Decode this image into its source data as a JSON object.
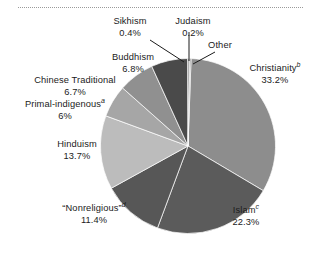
{
  "figure": {
    "type": "pie-chart",
    "rule": "dotted-separator"
  },
  "chart_data": {
    "type": "pie",
    "title": "",
    "xlabel": "",
    "ylabel": "",
    "legend_position": "callout-labels",
    "grid": false,
    "start_angle_deg": -88,
    "direction": "clockwise",
    "categories": [
      "Christianity",
      "Islam",
      "“Nonreligious”",
      "Hinduism",
      "Primal-indigenous",
      "Chinese Traditional",
      "Buddhism",
      "Sikhism",
      "Judaism",
      "Other"
    ],
    "values": [
      33.2,
      22.3,
      11.4,
      13.7,
      6,
      6.7,
      6.8,
      0.4,
      0.2,
      0.0
    ],
    "value_labels": [
      "33.2%",
      "22.3%",
      "11.4%",
      "13.7%",
      "6%",
      "6.7%",
      "6.8%",
      "0.4%",
      "0.2%",
      ""
    ],
    "slices": [
      {
        "name": "Christianity",
        "label": "Christianity",
        "footnote": "b",
        "value": 33.2,
        "value_label": "33.2%",
        "color": "#8d8d8d"
      },
      {
        "name": "Islam",
        "label": "Islam",
        "footnote": "c",
        "value": 22.3,
        "value_label": "22.3%",
        "color": "#5b5b5b"
      },
      {
        "name": "Nonreligious",
        "label": "“Nonreligious”",
        "footnote": "d",
        "value": 11.4,
        "value_label": "11.4%",
        "color": "#575757"
      },
      {
        "name": "Hinduism",
        "label": "Hinduism",
        "footnote": "",
        "value": 13.7,
        "value_label": "13.7%",
        "color": "#bcbcbc"
      },
      {
        "name": "Primal-indigenous",
        "label": "Primal-indigenous",
        "footnote": "a",
        "value": 6,
        "value_label": "6%",
        "color": "#a6a6a6"
      },
      {
        "name": "Chinese Traditional",
        "label": "Chinese Traditional",
        "footnote": "",
        "value": 6.7,
        "value_label": "6.7%",
        "color": "#909090"
      },
      {
        "name": "Buddhism",
        "label": "Buddhism",
        "footnote": "",
        "value": 6.8,
        "value_label": "6.8%",
        "color": "#4a4a4a"
      },
      {
        "name": "Sikhism",
        "label": "Sikhism",
        "footnote": "",
        "value": 0.4,
        "value_label": "0.4%",
        "color": "#9e9e9e"
      },
      {
        "name": "Judaism",
        "label": "Judaism",
        "footnote": "",
        "value": 0.2,
        "value_label": "0.2%",
        "color": "#6e6e6e"
      },
      {
        "name": "Other",
        "label": "Other",
        "footnote": "",
        "value": 0.0,
        "value_label": "",
        "color": "#a0a0a0"
      }
    ]
  },
  "labels": {
    "sikhism": {
      "name": "Sikhism",
      "pct": "0.4%"
    },
    "judaism": {
      "name": "Judaism",
      "pct": "0.2%"
    },
    "other": {
      "name": "Other",
      "pct": ""
    },
    "buddhism": {
      "name": "Buddhism",
      "pct": "6.8%"
    },
    "chinese": {
      "name": "Chinese Traditional",
      "pct": "6.7%"
    },
    "primal": {
      "name": "Primal-indigenous",
      "sup": "a",
      "pct": "6%"
    },
    "hinduism": {
      "name": "Hinduism",
      "pct": "13.7%"
    },
    "nonrel": {
      "name": "“Nonreligious”",
      "sup": "d",
      "pct": "11.4%"
    },
    "islam": {
      "name": "Islam",
      "sup": "c",
      "pct": "22.3%"
    },
    "christianity": {
      "name": "Christianity",
      "sup": "b",
      "pct": "33.2%"
    }
  }
}
